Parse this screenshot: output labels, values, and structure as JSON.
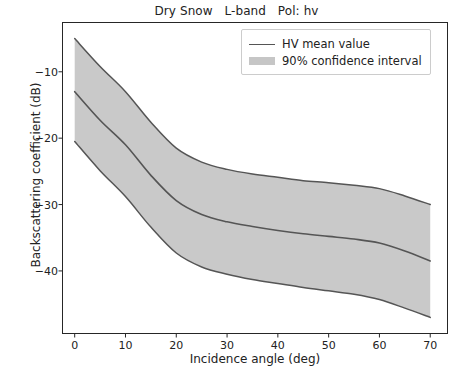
{
  "chart_data": {
    "type": "line",
    "title": "Dry Snow   L-band   Pol: hv",
    "xlabel": "Incidence angle (deg)",
    "ylabel": "Backscattering coefficient (dB)",
    "xlim": [
      -2.5,
      73.5
    ],
    "ylim": [
      -49.5,
      -2.5
    ],
    "xticks": [
      0,
      10,
      20,
      30,
      40,
      50,
      60,
      70
    ],
    "xtick_labels": [
      "0",
      "10",
      "20",
      "30",
      "40",
      "50",
      "60",
      "70"
    ],
    "yticks": [
      -10,
      -20,
      -30,
      -40
    ],
    "ytick_labels": [
      "−10",
      "−20",
      "−30",
      "−40"
    ],
    "grid": false,
    "legend_position": "upper right",
    "x": [
      0,
      5,
      10,
      15,
      20,
      25,
      30,
      35,
      40,
      45,
      50,
      55,
      60,
      65,
      70
    ],
    "series": [
      {
        "name": "HV mean value",
        "role": "mean",
        "color": "#555555",
        "values": [
          -13.0,
          -17.3,
          -21.0,
          -25.6,
          -29.4,
          -31.5,
          -32.6,
          -33.3,
          -33.9,
          -34.4,
          -34.8,
          -35.2,
          -35.8,
          -37.0,
          -38.5
        ]
      },
      {
        "name": "90% confidence interval",
        "role": "band_upper",
        "color": "#c6c6c6",
        "values": [
          -5.0,
          -9.2,
          -13.0,
          -17.6,
          -21.5,
          -23.6,
          -24.7,
          -25.4,
          -25.9,
          -26.4,
          -26.7,
          -27.1,
          -27.6,
          -28.7,
          -30.0
        ]
      },
      {
        "name": "90% confidence interval",
        "role": "band_lower",
        "color": "#c6c6c6",
        "values": [
          -20.5,
          -24.9,
          -28.8,
          -33.4,
          -37.3,
          -39.4,
          -40.5,
          -41.3,
          -41.9,
          -42.5,
          -43.0,
          -43.5,
          -44.3,
          -45.6,
          -47.0
        ]
      }
    ],
    "legend": [
      {
        "label": "HV mean value",
        "marker": "line",
        "color": "#555555"
      },
      {
        "label": "90% confidence interval",
        "marker": "patch",
        "color": "#c6c6c6"
      }
    ]
  },
  "colors": {
    "line": "#555555",
    "band": "#c6c6c6",
    "axis": "#262626",
    "background": "#ffffff"
  }
}
